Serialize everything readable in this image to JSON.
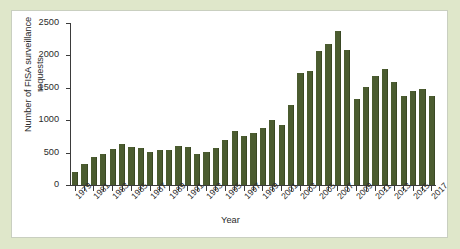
{
  "figure": {
    "panel_background": "#ffffff",
    "page_background": "#dfe7ca",
    "bar_color": "#4b5c30",
    "axis_color": "#3b3b3b"
  },
  "chart_data": {
    "type": "bar",
    "title": "",
    "xlabel": "Year",
    "ylabel": "Number of FISA surveillance requests",
    "ylim": [
      0,
      2500
    ],
    "ytick_labels": [
      "0",
      "500",
      "1000",
      "1500",
      "2000",
      "2500"
    ],
    "ytick_values": [
      0,
      500,
      1000,
      1500,
      2000,
      2500
    ],
    "grid": false,
    "legend": null,
    "categories": [
      "1979",
      "1980",
      "1981",
      "1982",
      "1983",
      "1984",
      "1985",
      "1986",
      "1987",
      "1988",
      "1989",
      "1990",
      "1991",
      "1992",
      "1993",
      "1994",
      "1995",
      "1996",
      "1997",
      "1998",
      "1999",
      "2000",
      "2001",
      "2002",
      "2003",
      "2004",
      "2005",
      "2006",
      "2007",
      "2008",
      "2009",
      "2010",
      "2011",
      "2012",
      "2013",
      "2014",
      "2015",
      "2016",
      "2017"
    ],
    "values": [
      207,
      322,
      433,
      475,
      549,
      635,
      587,
      573,
      512,
      534,
      546,
      595,
      593,
      484,
      509,
      576,
      697,
      839,
      749,
      796,
      880,
      1005,
      932,
      1228,
      1727,
      1758,
      2074,
      2176,
      2370,
      2083,
      1329,
      1511,
      1676,
      1789,
      1588,
      1379,
      1457,
      1485,
      1372
    ],
    "xtick_labels_shown": [
      "1979",
      "1981",
      "1983",
      "1985",
      "1987",
      "1989",
      "1991",
      "1993",
      "1995",
      "1997",
      "1999",
      "2001",
      "2003",
      "2005",
      "2007",
      "2009",
      "2011",
      "2013",
      "2015",
      "2017"
    ]
  }
}
